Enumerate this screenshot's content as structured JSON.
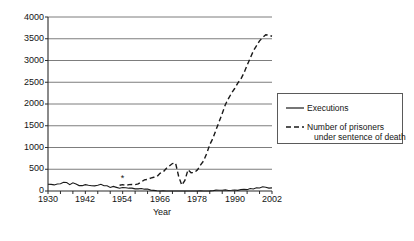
{
  "chart_data": {
    "type": "line",
    "title": "",
    "xlabel": "Year",
    "ylabel": "",
    "xlim": [
      1930,
      2002
    ],
    "ylim": [
      0,
      4000
    ],
    "grid": "horizontal",
    "legend_position": "right",
    "y_ticks": [
      0,
      500,
      1000,
      1500,
      2000,
      2500,
      3000,
      3500,
      4000
    ],
    "y_tick_labels": [
      "0",
      "500",
      "1000",
      "1500",
      "2000",
      "2500",
      "3000",
      "3500",
      "4000"
    ],
    "x_ticks": [
      1930,
      1942,
      1954,
      1966,
      1978,
      1990,
      2002
    ],
    "x_tick_labels": [
      "1930",
      "1942",
      "1954",
      "1966",
      "1978",
      "1990",
      "2002"
    ],
    "annotations": [
      {
        "text": "*",
        "x": 1954,
        "y": 300,
        "name": "asterisk-annotation"
      }
    ],
    "series": [
      {
        "name": "Executions",
        "style": "solid",
        "color": "#1a1a1a",
        "x": [
          1930,
          1931,
          1932,
          1933,
          1934,
          1935,
          1936,
          1937,
          1938,
          1939,
          1940,
          1941,
          1942,
          1943,
          1944,
          1945,
          1946,
          1947,
          1948,
          1949,
          1950,
          1951,
          1952,
          1953,
          1954,
          1955,
          1956,
          1957,
          1958,
          1959,
          1960,
          1961,
          1962,
          1963,
          1964,
          1965,
          1966,
          1967,
          1968,
          1969,
          1970,
          1971,
          1972,
          1973,
          1974,
          1975,
          1976,
          1977,
          1978,
          1979,
          1980,
          1981,
          1982,
          1983,
          1984,
          1985,
          1986,
          1987,
          1988,
          1989,
          1990,
          1991,
          1992,
          1993,
          1994,
          1995,
          1996,
          1997,
          1998,
          1999,
          2000,
          2001,
          2002
        ],
        "y": [
          155,
          153,
          140,
          160,
          168,
          199,
          195,
          147,
          190,
          160,
          124,
          123,
          147,
          131,
          120,
          117,
          131,
          153,
          119,
          119,
          82,
          105,
          83,
          62,
          81,
          76,
          65,
          65,
          49,
          49,
          56,
          42,
          47,
          21,
          15,
          7,
          1,
          2,
          0,
          0,
          0,
          0,
          0,
          0,
          0,
          0,
          0,
          1,
          0,
          2,
          0,
          1,
          2,
          5,
          21,
          18,
          18,
          25,
          11,
          16,
          23,
          14,
          31,
          38,
          31,
          56,
          45,
          74,
          68,
          98,
          85,
          66,
          71
        ]
      },
      {
        "name": "Number of prisoners under sentence of death",
        "style": "dashed",
        "color": "#1a1a1a",
        "x": [
          1953,
          1954,
          1955,
          1956,
          1957,
          1958,
          1959,
          1960,
          1961,
          1962,
          1963,
          1964,
          1965,
          1966,
          1967,
          1968,
          1969,
          1970,
          1971,
          1972,
          1973,
          1974,
          1975,
          1976,
          1977,
          1978,
          1979,
          1980,
          1981,
          1982,
          1983,
          1984,
          1985,
          1986,
          1987,
          1988,
          1989,
          1990,
          1991,
          1992,
          1993,
          1994,
          1995,
          1996,
          1997,
          1998,
          1999,
          2000,
          2001,
          2002
        ],
        "y": [
          131,
          147,
          125,
          146,
          151,
          147,
          164,
          210,
          257,
          267,
          297,
          315,
          331,
          406,
          435,
          517,
          575,
          631,
          642,
          334,
          134,
          244,
          488,
          420,
          423,
          482,
          593,
          691,
          860,
          1066,
          1209,
          1405,
          1591,
          1781,
          1984,
          2124,
          2250,
          2356,
          2482,
          2575,
          2716,
          2890,
          3054,
          3219,
          3335,
          3452,
          3527,
          3593,
          3581,
          3557
        ]
      }
    ]
  },
  "axes": {
    "y_label_0": "0",
    "y_label_500": "500",
    "y_label_1000": "1000",
    "y_label_1500": "1500",
    "y_label_2000": "2000",
    "y_label_2500": "2500",
    "y_label_3000": "3000",
    "y_label_3500": "3500",
    "y_label_4000": "4000",
    "x_label_1": "1930",
    "x_label_2": "1942",
    "x_label_3": "1954",
    "x_label_4": "1966",
    "x_label_5": "1978",
    "x_label_6": "1990",
    "x_label_7": "2002",
    "x_axis_title": "Year"
  },
  "legend": {
    "entry_1": "Executions",
    "entry_2_line_1": "Number of prisoners",
    "entry_2_line_2": "under sentence of death"
  },
  "annotation": {
    "asterisk": "*"
  }
}
